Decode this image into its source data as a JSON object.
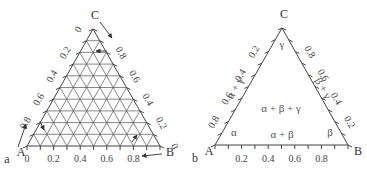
{
  "panels": [
    {
      "id": "a",
      "panel_label": "a",
      "vertices": {
        "A": "A",
        "B": "B",
        "C": "C"
      },
      "bottom_ticks": [
        "0",
        "0.2",
        "0.4",
        "0.6",
        "0.8"
      ],
      "left_ticks": [
        "0.8",
        "0.6",
        "0.4",
        "0.2",
        "0"
      ],
      "right_ticks": [
        "0.8",
        "0.6",
        "0.4",
        "0.2",
        "0"
      ],
      "grid_divisions": 10,
      "description": "Ternary composition grid with reading direction arrows"
    },
    {
      "id": "b",
      "panel_label": "b",
      "vertices": {
        "A": "A",
        "B": "B",
        "C": "C"
      },
      "bottom_ticks": [
        "0.2",
        "0.4",
        "0.6",
        "0.8"
      ],
      "left_ticks": [
        "0.8",
        "0.6",
        "0.4",
        "0.2"
      ],
      "right_ticks": [
        "0.8",
        "0.6",
        "0.4",
        "0.2"
      ],
      "phase_labels": {
        "alpha": "α",
        "beta": "β",
        "gamma": "γ",
        "alpha_beta": "α + β",
        "alpha_gamma": "α + γ",
        "beta_gamma": "β + γ",
        "alpha_beta_gamma": "α + β + γ"
      },
      "description": "Ternary isothermal section with three-phase region"
    }
  ]
}
